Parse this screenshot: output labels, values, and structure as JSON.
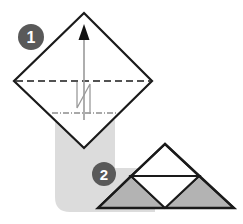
{
  "figure": {
    "background_color": "#ffffff",
    "width": 243,
    "height": 224
  },
  "palette": {
    "stroke": "#1a1a1a",
    "badge_fill": "#595959",
    "badge_label": "#ffffff",
    "paper_white": "#ffffff",
    "paper_gray": "#b3b3b3",
    "shadow_gray": "#dcdcdc",
    "fold_line": "#333333",
    "arrow": "#8c8c8c"
  },
  "steps": [
    {
      "number": "1",
      "badge": {
        "cx": 31,
        "cy": 37,
        "r": 13
      },
      "shape": "diamond",
      "description": "Square rotated 45 degrees with horizontal valley crease and mountain crease below, folded upward",
      "vertices": {
        "top": [
          84,
          13
        ],
        "left": [
          14,
          81
        ],
        "right": [
          152,
          81
        ],
        "bottom": [
          84,
          148
        ]
      },
      "creases": [
        {
          "name": "valley-crease",
          "style": "dashed",
          "y": 81,
          "x1": 16,
          "x2": 150
        },
        {
          "name": "mountain-crease",
          "style": "dash-dot",
          "y": 113,
          "x1": 52,
          "x2": 116
        }
      ],
      "arrow": {
        "name": "fold-up-arrow",
        "direction": "up",
        "x": 84,
        "y_tail": 120,
        "y_head": 26
      },
      "pleat_marker": {
        "name": "pleat-zigzag",
        "points": "77,82 77,108 90,84 90,113"
      }
    },
    {
      "number": "2",
      "badge": {
        "cx": 104,
        "cy": 174,
        "r": 12
      },
      "shape": "triangle",
      "description": "Resulting triangle divided into four sub-triangles, two gray at the base and two white",
      "vertices": {
        "apex": [
          165,
          144
        ],
        "bottom_left": [
          98,
          208
        ],
        "bottom_right": [
          234,
          208
        ]
      },
      "midpoints": {
        "left_mid": [
          131,
          176
        ],
        "right_mid": [
          199,
          176
        ],
        "base_mid": [
          165,
          208
        ]
      },
      "sub_triangles": [
        {
          "name": "top-sub-triangle",
          "fill": "white"
        },
        {
          "name": "center-sub-triangle",
          "fill": "white"
        },
        {
          "name": "bottom-left-sub-triangle",
          "fill": "gray"
        },
        {
          "name": "bottom-right-sub-triangle",
          "fill": "gray"
        }
      ],
      "midline": {
        "name": "horizontal-midline",
        "x1": 131,
        "y1": 176,
        "x2": 199,
        "y2": 176
      }
    }
  ],
  "shadow": {
    "name": "drop-shadow-backdrop",
    "fill": "#dcdcdc",
    "description": "Rounded light gray L-shaped backdrop behind both steps"
  }
}
